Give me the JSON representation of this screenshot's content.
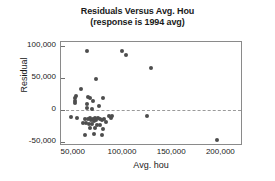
{
  "chart_data": {
    "type": "scatter",
    "title": "Residuals Versus Avg. Hou",
    "subtitle": "(response is 1994 avg)",
    "xlabel": "Avg. hou",
    "ylabel": "Residual",
    "xlim": [
      37000,
      222000
    ],
    "ylim": [
      -56000,
      106000
    ],
    "xticks": [
      50000,
      100000,
      150000,
      200000
    ],
    "xticklabels": [
      "50,000",
      "100,000",
      "150,000",
      "200,000"
    ],
    "yticks": [
      100000,
      50000,
      0,
      -50000
    ],
    "yticklabels": [
      "100,000",
      "50,000",
      "0",
      "-50,000"
    ],
    "grid": false,
    "legend": null,
    "reference_line": {
      "axis": "y",
      "value": 0,
      "style": "dashed"
    },
    "marker": {
      "shape": "circle",
      "color": "#4d4d4d",
      "size": 4
    },
    "points": [
      {
        "x": 63500,
        "y": 92000
      },
      {
        "x": 99500,
        "y": 92000
      },
      {
        "x": 103500,
        "y": 85500
      },
      {
        "x": 128000,
        "y": 65000
      },
      {
        "x": 72500,
        "y": 48500
      },
      {
        "x": 57500,
        "y": 33000
      },
      {
        "x": 52500,
        "y": 22000
      },
      {
        "x": 64500,
        "y": 21000
      },
      {
        "x": 66000,
        "y": 19500
      },
      {
        "x": 51500,
        "y": 18000
      },
      {
        "x": 79500,
        "y": 18000
      },
      {
        "x": 51500,
        "y": 14000
      },
      {
        "x": 69500,
        "y": 13500
      },
      {
        "x": 51500,
        "y": 10500
      },
      {
        "x": 63500,
        "y": 9500
      },
      {
        "x": 75500,
        "y": 6000
      },
      {
        "x": 63000,
        "y": 3000
      },
      {
        "x": 68500,
        "y": 1500
      },
      {
        "x": 47500,
        "y": -11500
      },
      {
        "x": 53000,
        "y": -12000
      },
      {
        "x": 85500,
        "y": -9500
      },
      {
        "x": 88500,
        "y": -10000
      },
      {
        "x": 88000,
        "y": -12500
      },
      {
        "x": 124000,
        "y": -9000
      },
      {
        "x": 61500,
        "y": -13500
      },
      {
        "x": 64500,
        "y": -14000
      },
      {
        "x": 66500,
        "y": -13000
      },
      {
        "x": 67500,
        "y": -15500
      },
      {
        "x": 69500,
        "y": -14000
      },
      {
        "x": 70500,
        "y": -16500
      },
      {
        "x": 71500,
        "y": -13000
      },
      {
        "x": 72500,
        "y": -15000
      },
      {
        "x": 74500,
        "y": -12500
      },
      {
        "x": 76500,
        "y": -14500
      },
      {
        "x": 78500,
        "y": -16000
      },
      {
        "x": 80500,
        "y": -13500
      },
      {
        "x": 82500,
        "y": -18000
      },
      {
        "x": 59500,
        "y": -19500
      },
      {
        "x": 62500,
        "y": -20500
      },
      {
        "x": 65500,
        "y": -21500
      },
      {
        "x": 68500,
        "y": -22500
      },
      {
        "x": 73500,
        "y": -24000
      },
      {
        "x": 76500,
        "y": -23000
      },
      {
        "x": 66500,
        "y": -28000
      },
      {
        "x": 71500,
        "y": -28500
      },
      {
        "x": 79500,
        "y": -29500
      },
      {
        "x": 61500,
        "y": -39500
      },
      {
        "x": 70500,
        "y": -38000
      },
      {
        "x": 79000,
        "y": -38500
      },
      {
        "x": 196000,
        "y": -46500
      }
    ]
  }
}
